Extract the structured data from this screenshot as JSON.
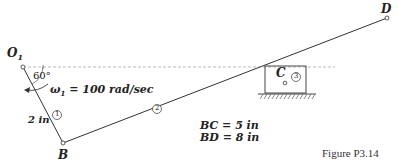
{
  "figure": {
    "caption": "Figure P3.14",
    "points": {
      "O1": {
        "label": "O",
        "sub": "1"
      },
      "B": {
        "label": "B"
      },
      "C": {
        "label": "C"
      },
      "D": {
        "label": "D"
      }
    },
    "angle_label": "60°",
    "omega_label": {
      "symbol": "ω",
      "sub": "1",
      "value": " = 100 rad/sec"
    },
    "link_length_label": "2 in",
    "link_numbers": [
      "1",
      "2",
      "3"
    ],
    "dimensions": [
      "BC = 5 in",
      "BD = 8 in"
    ],
    "colors": {
      "line": "#333333",
      "dashed": "#999999",
      "text": "#222222"
    }
  }
}
